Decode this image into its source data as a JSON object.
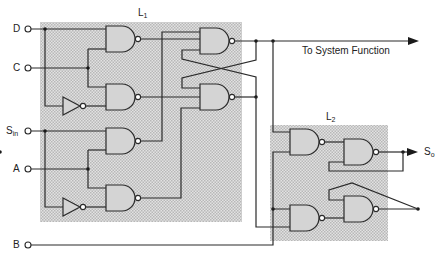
{
  "diagram": {
    "blocks": [
      {
        "id": "L1",
        "label": "L",
        "subscript": "1"
      },
      {
        "id": "L2",
        "label": "L",
        "subscript": "2"
      }
    ],
    "inputs": [
      {
        "id": "D",
        "label": "D",
        "subscript": ""
      },
      {
        "id": "C",
        "label": "C",
        "subscript": ""
      },
      {
        "id": "Sin",
        "label": "S",
        "subscript": "in"
      },
      {
        "id": "A",
        "label": "A",
        "subscript": ""
      },
      {
        "id": "B",
        "label": "B",
        "subscript": ""
      }
    ],
    "outputs": [
      {
        "id": "sys",
        "label": "To System Function"
      },
      {
        "id": "So",
        "label": "S",
        "subscript": "o"
      }
    ],
    "colors": {
      "shading": "#d4d4d4",
      "line": "#2a2a2a",
      "background": "#ffffff"
    }
  }
}
